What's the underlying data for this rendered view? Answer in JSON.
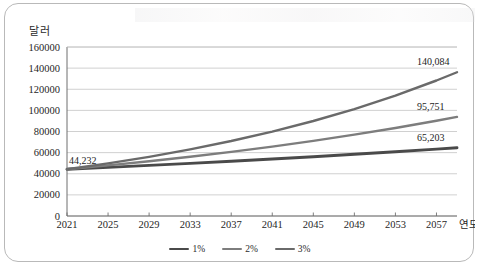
{
  "chart_data": {
    "type": "line",
    "title": "",
    "xlabel": "연도",
    "ylabel": "달러",
    "xlim": [
      2021,
      2059
    ],
    "ylim": [
      0,
      160000
    ],
    "grid": true,
    "legend_position": "bottom-center",
    "x_tick_labels": [
      "2021",
      "2025",
      "2029",
      "2033",
      "2037",
      "2041",
      "2045",
      "2049",
      "2053",
      "2057"
    ],
    "x_ticks": [
      2021,
      2025,
      2029,
      2033,
      2037,
      2041,
      2045,
      2049,
      2053,
      2057
    ],
    "y_tick_labels": [
      "0",
      "20000",
      "40000",
      "60000",
      "80000",
      "100000",
      "120000",
      "140000",
      "160000"
    ],
    "y_ticks": [
      0,
      20000,
      40000,
      60000,
      80000,
      100000,
      120000,
      140000,
      160000
    ],
    "start_value": 44232,
    "start_label": "44,232",
    "x": [
      2021,
      2025,
      2029,
      2033,
      2037,
      2041,
      2045,
      2049,
      2053,
      2057,
      2059
    ],
    "series": [
      {
        "name": "1%",
        "color": "#4a4a4a",
        "end_label": "65,203",
        "end_value": 65203,
        "values": [
          44232,
          46028,
          47897,
          49842,
          51866,
          53972,
          56164,
          58445,
          60819,
          63289,
          64560
        ]
      },
      {
        "name": "2%",
        "color": "#7d7d7d",
        "end_label": "95,751",
        "end_value": 95751,
        "values": [
          44232,
          47877,
          51822,
          56092,
          60714,
          65717,
          71133,
          76995,
          83340,
          90208,
          93855
        ]
      },
      {
        "name": "3%",
        "color": "#6a6a6a",
        "end_label": "140,084",
        "end_value": 140084,
        "values": [
          44232,
          49787,
          56039,
          63077,
          70999,
          79917,
          89954,
          101252,
          113970,
          128286,
          136101
        ]
      }
    ]
  },
  "legend": {
    "entries": [
      {
        "label": "1%",
        "color": "#4a4a4a"
      },
      {
        "label": "2%",
        "color": "#7d7d7d"
      },
      {
        "label": "3%",
        "color": "#6a6a6a"
      }
    ]
  }
}
